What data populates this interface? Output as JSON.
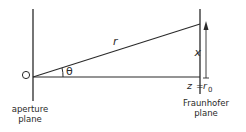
{
  "diagram": {
    "origin_label": "O",
    "angle_label": "θ",
    "r_label": "r",
    "x_label": "x",
    "z_label": "z",
    "equals": "=",
    "r0_label": "r",
    "r0_sub": "0",
    "aperture_label_line1": "aperture",
    "aperture_label_line2": "plane",
    "fraunhofer_label_line1": "Fraunhofer",
    "fraunhofer_label_line2": "plane"
  },
  "colors": {
    "line": "#2a2a2a",
    "background": "#ffffff"
  }
}
